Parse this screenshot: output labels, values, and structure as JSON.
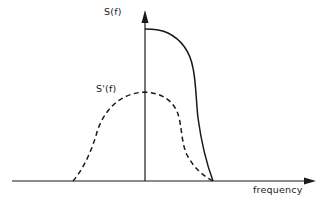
{
  "figure": {
    "x_axis_label": "frequency",
    "y_axis_label": "S(f)",
    "curves": [
      {
        "name": "S(f)",
        "label": "S(f)",
        "style": "solid",
        "description": "One-sided spectrum: starts at maximum on the vertical axis, stays high, then rolls off steeply to zero at the cutoff frequency"
      },
      {
        "name": "S'(f)",
        "label": "S'(f)",
        "style": "dashed",
        "description": "Two-sided bell-shaped spectrum centered on the vertical axis, lower peak, reaching zero at the same cutoff as S(f) on the positive side"
      }
    ],
    "colors": {
      "line": "#1a1a1a",
      "background": "#ffffff"
    }
  }
}
